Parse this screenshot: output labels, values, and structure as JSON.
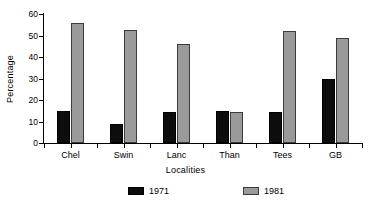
{
  "chart_data": {
    "type": "bar",
    "title": "",
    "xlabel": "Localities",
    "ylabel": "Percentage",
    "categories": [
      "Chel",
      "Swin",
      "Lanc",
      "Than",
      "Tees",
      "GB"
    ],
    "series": [
      {
        "name": "1971",
        "color": "#0d0d0d",
        "values": [
          15,
          9,
          14.5,
          15,
          14.5,
          30
        ]
      },
      {
        "name": "1981",
        "color": "#9a9a9a",
        "values": [
          56,
          52.5,
          46,
          14.5,
          52,
          49
        ]
      }
    ],
    "ylim": [
      0,
      60
    ],
    "yticks": [
      0,
      10,
      20,
      30,
      40,
      50,
      60
    ],
    "ytick_labels": [
      "0",
      "10",
      "20",
      "30",
      "40",
      "50",
      "60"
    ],
    "grid": false,
    "legend_position": "bottom"
  },
  "axes": {
    "y_title": "Percentage",
    "x_title": "Localities"
  },
  "legend": {
    "entries": [
      {
        "label": "1971"
      },
      {
        "label": "1981"
      }
    ]
  }
}
